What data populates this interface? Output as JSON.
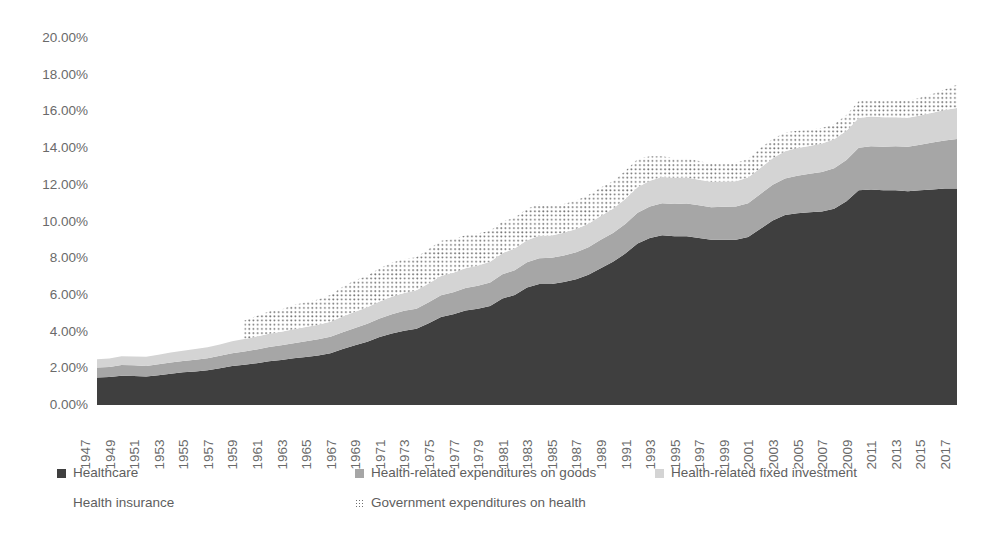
{
  "chart_data": {
    "type": "area",
    "stacked": true,
    "title": "",
    "xlabel": "",
    "ylabel": "",
    "grid": false,
    "legend_position": "bottom",
    "ylim": [
      0,
      20
    ],
    "ytick_labels": [
      "20.00%",
      "18.00%",
      "16.00%",
      "14.00%",
      "12.00%",
      "10.00%",
      "8.00%",
      "6.00%",
      "4.00%",
      "2.00%",
      "0.00%"
    ],
    "ytick_values": [
      20,
      18,
      16,
      14,
      12,
      10,
      8,
      6,
      4,
      2,
      0
    ],
    "x": [
      1947,
      1948,
      1949,
      1950,
      1951,
      1952,
      1953,
      1954,
      1955,
      1956,
      1957,
      1958,
      1959,
      1960,
      1961,
      1962,
      1963,
      1964,
      1965,
      1966,
      1967,
      1968,
      1969,
      1970,
      1971,
      1972,
      1973,
      1974,
      1975,
      1976,
      1977,
      1978,
      1979,
      1980,
      1981,
      1982,
      1983,
      1984,
      1985,
      1986,
      1987,
      1988,
      1989,
      1990,
      1991,
      1992,
      1993,
      1994,
      1995,
      1996,
      1997,
      1998,
      1999,
      2000,
      2001,
      2002,
      2003,
      2004,
      2005,
      2006,
      2007,
      2008,
      2009,
      2010,
      2011,
      2012,
      2013,
      2014,
      2015,
      2016,
      2017
    ],
    "xtick_labels": [
      "1947",
      "1949",
      "1951",
      "1953",
      "1955",
      "1957",
      "1959",
      "1961",
      "1963",
      "1965",
      "1967",
      "1969",
      "1971",
      "1973",
      "1975",
      "1977",
      "1979",
      "1981",
      "1983",
      "1985",
      "1987",
      "1989",
      "1991",
      "1993",
      "1995",
      "1997",
      "1999",
      "2001",
      "2003",
      "2005",
      "2007",
      "2009",
      "2011",
      "2013",
      "2015",
      "2017"
    ],
    "series": [
      {
        "name": "Healthcare",
        "color": "#3f3f3f",
        "pattern": "solid",
        "values": [
          1.5,
          1.52,
          1.6,
          1.58,
          1.55,
          1.62,
          1.7,
          1.78,
          1.82,
          1.9,
          2.0,
          2.12,
          2.2,
          2.28,
          2.38,
          2.45,
          2.55,
          2.62,
          2.7,
          2.82,
          3.05,
          3.25,
          3.45,
          3.7,
          3.9,
          4.05,
          4.15,
          4.45,
          4.8,
          4.95,
          5.15,
          5.25,
          5.4,
          5.8,
          6.0,
          6.4,
          6.6,
          6.6,
          6.7,
          6.85,
          7.1,
          7.45,
          7.8,
          8.25,
          8.8,
          9.1,
          9.25,
          9.2,
          9.2,
          9.1,
          9.0,
          9.0,
          9.0,
          9.15,
          9.6,
          10.05,
          10.35,
          10.45,
          10.5,
          10.55,
          10.7,
          11.1,
          11.7,
          11.75,
          11.7,
          11.7,
          11.65,
          11.7,
          11.75,
          11.8,
          11.8
        ]
      },
      {
        "name": "Health-related expenditures on goods",
        "color": "#a6a6a6",
        "pattern": "solid",
        "values": [
          0.55,
          0.55,
          0.58,
          0.58,
          0.58,
          0.6,
          0.62,
          0.62,
          0.65,
          0.65,
          0.68,
          0.7,
          0.72,
          0.75,
          0.78,
          0.8,
          0.82,
          0.85,
          0.88,
          0.9,
          0.92,
          0.95,
          0.98,
          1.02,
          1.05,
          1.08,
          1.1,
          1.15,
          1.18,
          1.2,
          1.22,
          1.25,
          1.28,
          1.32,
          1.35,
          1.38,
          1.4,
          1.42,
          1.45,
          1.48,
          1.5,
          1.55,
          1.58,
          1.62,
          1.68,
          1.72,
          1.75,
          1.76,
          1.78,
          1.78,
          1.78,
          1.8,
          1.82,
          1.85,
          1.9,
          1.95,
          2.0,
          2.05,
          2.1,
          2.15,
          2.2,
          2.25,
          2.32,
          2.35,
          2.38,
          2.4,
          2.42,
          2.48,
          2.55,
          2.62,
          2.7
        ]
      },
      {
        "name": "Health-related fixed investment",
        "color": "#d4d4d4",
        "pattern": "solid",
        "values": [
          0.45,
          0.46,
          0.48,
          0.48,
          0.5,
          0.52,
          0.54,
          0.55,
          0.58,
          0.6,
          0.62,
          0.65,
          0.68,
          0.7,
          0.72,
          0.74,
          0.76,
          0.78,
          0.8,
          0.82,
          0.85,
          0.88,
          0.9,
          0.92,
          0.95,
          0.98,
          1.0,
          1.02,
          1.05,
          1.06,
          1.08,
          1.1,
          1.12,
          1.15,
          1.18,
          1.2,
          1.22,
          1.22,
          1.24,
          1.26,
          1.28,
          1.3,
          1.32,
          1.35,
          1.38,
          1.4,
          1.42,
          1.42,
          1.42,
          1.4,
          1.38,
          1.38,
          1.38,
          1.4,
          1.42,
          1.45,
          1.48,
          1.5,
          1.52,
          1.55,
          1.58,
          1.6,
          1.62,
          1.62,
          1.6,
          1.58,
          1.58,
          1.6,
          1.62,
          1.65,
          1.68
        ]
      },
      {
        "name": "Health insurance",
        "color": "#ffffff",
        "pattern": "solid",
        "values": [
          0.0,
          0.0,
          0.0,
          0.0,
          0.0,
          0.0,
          0.0,
          0.0,
          0.0,
          0.0,
          0.0,
          0.0,
          0.0,
          0.0,
          0.0,
          0.0,
          0.0,
          0.0,
          0.0,
          0.0,
          0.0,
          0.0,
          0.0,
          0.0,
          0.0,
          0.0,
          0.0,
          0.0,
          0.0,
          0.0,
          0.0,
          0.0,
          0.0,
          0.0,
          0.0,
          0.0,
          0.0,
          0.0,
          0.0,
          0.0,
          0.0,
          0.0,
          0.0,
          0.0,
          0.0,
          0.0,
          0.0,
          0.0,
          0.0,
          0.0,
          0.0,
          0.0,
          0.0,
          0.0,
          0.0,
          0.0,
          0.0,
          0.0,
          0.0,
          0.0,
          0.0,
          0.0,
          0.0,
          0.0,
          0.0,
          0.0,
          0.0,
          0.0,
          0.0,
          0.0,
          0.0
        ]
      },
      {
        "name": "Government expenditures on health",
        "color": "#6f6f6f",
        "pattern": "dotted",
        "start_year": 1959,
        "values": [
          null,
          null,
          null,
          null,
          null,
          null,
          null,
          null,
          null,
          null,
          null,
          null,
          4.6,
          4.85,
          5.1,
          5.2,
          5.45,
          5.6,
          5.75,
          6.0,
          6.45,
          6.8,
          7.05,
          7.45,
          7.75,
          7.95,
          8.05,
          8.5,
          8.95,
          9.05,
          9.25,
          9.35,
          9.5,
          10.0,
          10.2,
          10.7,
          10.95,
          10.85,
          10.95,
          11.15,
          11.45,
          11.85,
          12.2,
          12.75,
          13.4,
          13.55,
          13.55,
          13.45,
          13.45,
          13.3,
          13.15,
          13.15,
          13.2,
          13.4,
          14.0,
          14.5,
          14.85,
          14.95,
          15.0,
          15.1,
          15.3,
          15.8,
          16.55,
          16.6,
          16.55,
          16.6,
          16.6,
          16.75,
          16.95,
          17.2,
          17.45
        ]
      }
    ]
  },
  "legend": {
    "items": [
      {
        "label": "Healthcare",
        "marker": "dark-square-swatch",
        "color": "#3f3f3f",
        "row": 0,
        "col": 0
      },
      {
        "label": "Health-related expenditures on goods",
        "marker": "medium-square-swatch",
        "color": "#a6a6a6",
        "row": 0,
        "col": 1
      },
      {
        "label": "Health-related fixed investment",
        "marker": "light-square-swatch",
        "color": "#d4d4d4",
        "row": 0,
        "col": 2
      },
      {
        "label": "Health insurance",
        "marker": "white-square-swatch",
        "color": "#ffffff",
        "row": 1,
        "col": 0
      },
      {
        "label": "Government expenditures on health",
        "marker": "dotted-square-swatch",
        "color": "#6f6f6f",
        "row": 1,
        "col": 1
      }
    ]
  }
}
